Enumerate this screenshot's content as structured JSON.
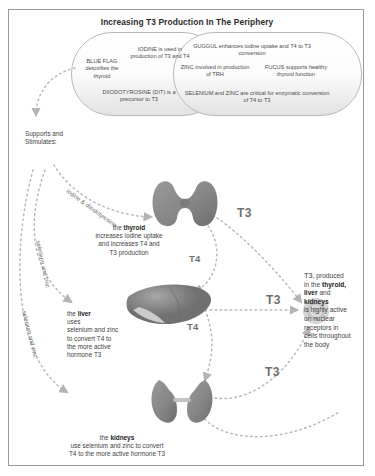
{
  "diagram": {
    "title": "Increasing T3 Production In The Periphery",
    "callout_left": {
      "blue_flag": "BLUE\nFLAG\ndetoxifies\nthe thyroid",
      "iodine": "IODINE is used\nin production of\nT3 and T4",
      "dit": "DIIODOTYROSINE (DIT)\nis a precursor to T3"
    },
    "callout_right": {
      "guggul": "GUGGUL enhances iodine\nuptake and T4 to T3 conversion",
      "zinc": "ZINC involved\nin production of TRH",
      "fucus": "FUCUS supports\nhealthy thyroid\nfunction",
      "selenium": "SELENIUM and ZINC are critical\nfor enzymatic conversion of T4 to T3"
    },
    "supports_label": "Supports and\nStimulates:",
    "path_labels": {
      "iodine_dit": "iodine & diiodotyrosine",
      "selenium_zinc_1": "selenium and zinc",
      "selenium_zinc_2": "selenium and zinc"
    },
    "organs": [
      {
        "name": "thyroid",
        "caption_prefix": "the ",
        "caption_bold": "thyroid",
        "caption_body": "increases iodine uptake\nand increases T4 and\nT3 production"
      },
      {
        "name": "liver",
        "caption_prefix": "the ",
        "caption_bold": "liver",
        "caption_body": "uses\nselenium and zinc\nto convert T4 to\nthe more active\nhormone T3"
      },
      {
        "name": "kidneys",
        "caption_prefix": "the ",
        "caption_bold": "kidneys",
        "caption_body": "use selenium and zinc to convert\nT4 to the more active hormone T3"
      }
    ],
    "hormones": {
      "t3_1": "T3",
      "t3_2": "T3",
      "t3_3": "T3",
      "t4_1": "T4",
      "t4_2": "T4"
    },
    "right_text": {
      "line1": "T3",
      "line1b": ", produced",
      "line2": "in the ",
      "line2b": "thyroid,",
      "line3": "liver",
      "line3b": " and",
      "line4": "kidneys",
      "line5": "is highly active\non nuclear\nreceptors in\ncells throughout\nthe body"
    },
    "colors": {
      "organ_fill": "#8c8c8c",
      "organ_dark": "#6f6f6f",
      "dash": "#b0b0b0",
      "text": "#3f3f3f",
      "border": "#9a9a9a"
    }
  }
}
